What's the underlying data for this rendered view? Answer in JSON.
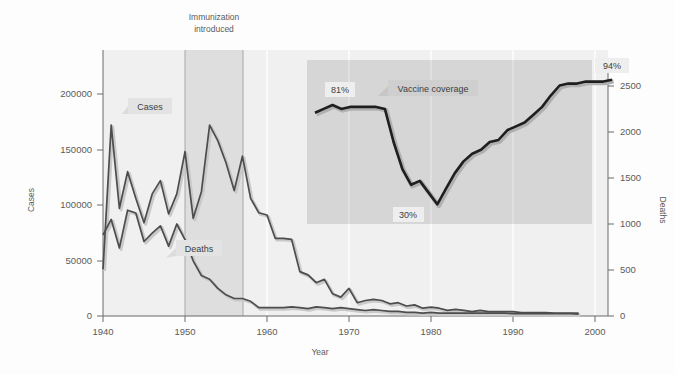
{
  "figure": {
    "background": "#fdfdfd",
    "plot_background": "#f0f0f0",
    "band_color": "#dedede",
    "inset_background": "#d6d6d6",
    "line_color": "#4d4d4d",
    "line_color_dark": "#1f1f1f",
    "callout_background": "#e3e3e3",
    "grid_color": "#ffffff",
    "axis_color": "#6b6b6b"
  },
  "labels": {
    "immunization_line1": "Immunization",
    "immunization_line2": "introduced",
    "cases_callout": "Cases",
    "deaths_callout": "Deaths",
    "vaccine_coverage_callout": "Vaccine coverage",
    "coverage_start_pct": "81%",
    "coverage_min_pct": "30%",
    "coverage_end_pct": "94%",
    "xlabel": "Year",
    "ylabel_left": "Cases",
    "ylabel_right": "Deaths"
  },
  "chart_data": {
    "type": "line",
    "title": "",
    "xlabel": "Year",
    "ylabel": "Cases",
    "ylabel_secondary": "Deaths",
    "xlim": [
      1939,
      2000
    ],
    "ylim": [
      0,
      235000
    ],
    "ylim_secondary": [
      0,
      2900
    ],
    "xticks": [
      1940,
      1950,
      1960,
      1970,
      1980,
      1990,
      2000
    ],
    "yticks_left": [
      0,
      50000,
      100000,
      150000,
      200000
    ],
    "yticks_right": [
      0,
      500,
      1000,
      1500,
      2000,
      2500
    ],
    "grid": "vertical-only",
    "legend": "inline-callouts",
    "annotations": [
      {
        "text": "Immunization introduced",
        "x_start": 1950,
        "x_end": 1957,
        "type": "shaded-band"
      },
      {
        "text": "Cases",
        "x": 1943,
        "y": 188000,
        "type": "callout"
      },
      {
        "text": "Deaths",
        "x": 1951,
        "y": 62000,
        "type": "callout"
      },
      {
        "text": "Vaccine coverage",
        "x": 1972,
        "y": 0,
        "type": "inset-callout"
      },
      {
        "text": "81%",
        "x": 1968,
        "type": "inset-point-label"
      },
      {
        "text": "30%",
        "x": 1978,
        "type": "inset-point-label"
      },
      {
        "text": "94%",
        "x": 1998,
        "type": "inset-point-label"
      }
    ],
    "series": [
      {
        "name": "Cases",
        "axis": "left",
        "x": [
          1940,
          1941,
          1942,
          1943,
          1944,
          1945,
          1946,
          1947,
          1948,
          1949,
          1950,
          1951,
          1952,
          1953,
          1954,
          1955,
          1956,
          1957,
          1958,
          1959,
          1960,
          1961,
          1962,
          1963,
          1964,
          1965,
          1966,
          1967,
          1968,
          1969,
          1970,
          1971,
          1972,
          1973,
          1974,
          1975,
          1976,
          1977,
          1978,
          1979,
          1980,
          1981,
          1982,
          1983,
          1984,
          1985,
          1986,
          1987,
          1988,
          1989,
          1990,
          1991,
          1992,
          1993,
          1994,
          1995,
          1996,
          1997,
          1998
        ],
        "values": [
          42000,
          172000,
          97000,
          130000,
          106000,
          84000,
          110000,
          122000,
          92000,
          110000,
          148000,
          88000,
          112000,
          172000,
          158000,
          138000,
          113000,
          144000,
          106000,
          93000,
          91000,
          70000,
          70000,
          69000,
          40000,
          37000,
          30000,
          33000,
          20000,
          17000,
          25000,
          12000,
          14000,
          15000,
          14000,
          11000,
          12000,
          9000,
          10000,
          7000,
          8000,
          7000,
          5000,
          6000,
          5000,
          4000,
          5000,
          4000,
          4000,
          4000,
          4000,
          3000,
          3000,
          3000,
          3000,
          2500,
          2500,
          2500,
          2500
        ]
      },
      {
        "name": "Deaths",
        "axis": "right",
        "x": [
          1940,
          1941,
          1942,
          1943,
          1944,
          1945,
          1946,
          1947,
          1948,
          1949,
          1950,
          1951,
          1952,
          1953,
          1954,
          1955,
          1956,
          1957,
          1958,
          1959,
          1960,
          1961,
          1962,
          1963,
          1964,
          1965,
          1966,
          1967,
          1968,
          1969,
          1970,
          1971,
          1972,
          1973,
          1974,
          1975,
          1976,
          1977,
          1978,
          1979,
          1980,
          1981,
          1982,
          1983,
          1984,
          1985,
          1986,
          1987,
          1988,
          1989,
          1990,
          1991,
          1992,
          1993,
          1994,
          1995,
          1996,
          1997,
          1998
        ],
        "values": [
          880,
          1050,
          740,
          1150,
          1120,
          810,
          900,
          980,
          760,
          1000,
          830,
          600,
          440,
          400,
          300,
          230,
          190,
          190,
          160,
          90,
          90,
          90,
          90,
          100,
          90,
          80,
          100,
          90,
          80,
          90,
          80,
          70,
          60,
          70,
          60,
          50,
          50,
          40,
          40,
          30,
          40,
          30,
          30,
          30,
          30,
          30,
          30,
          30,
          30,
          30,
          25,
          25,
          25,
          25,
          25,
          25,
          25,
          25,
          20
        ]
      }
    ],
    "inset": {
      "title": "Vaccine coverage",
      "type": "line",
      "ylabel": "Coverage (%)",
      "xlim": [
        1963,
        1999
      ],
      "ylim": [
        20,
        100
      ],
      "x": [
        1964,
        1965,
        1966,
        1967,
        1968,
        1969,
        1970,
        1971,
        1972,
        1973,
        1974,
        1975,
        1976,
        1977,
        1978,
        1979,
        1980,
        1981,
        1982,
        1983,
        1984,
        1985,
        1986,
        1987,
        1988,
        1989,
        1990,
        1991,
        1992,
        1993,
        1994,
        1995,
        1996,
        1997,
        1998
      ],
      "values": [
        77,
        79,
        81,
        79,
        80,
        80,
        80,
        80,
        79,
        62,
        48,
        40,
        42,
        36,
        30,
        38,
        46,
        52,
        56,
        58,
        62,
        63,
        68,
        70,
        72,
        76,
        80,
        86,
        91,
        92,
        92,
        93,
        93,
        93,
        94
      ],
      "start_label": "81%",
      "min_label": "30%",
      "end_label": "94%"
    }
  }
}
